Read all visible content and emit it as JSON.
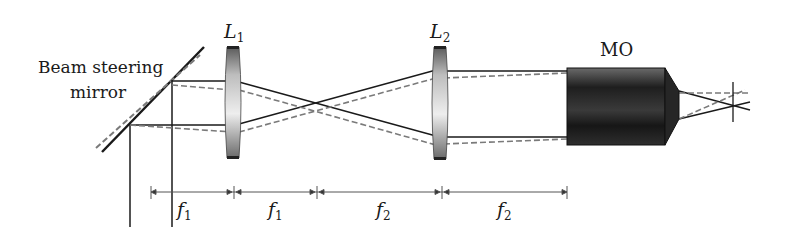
{
  "labels": {
    "mirror_line1": "Beam steering",
    "mirror_line2": "mirror",
    "lens1": {
      "main": "L",
      "sub": "1"
    },
    "lens2": {
      "main": "L",
      "sub": "2"
    },
    "objective": "MO"
  },
  "dimensions": [
    {
      "main": "f",
      "sub": "1"
    },
    {
      "main": "f",
      "sub": "1"
    },
    {
      "main": "f",
      "sub": "2"
    },
    {
      "main": "f",
      "sub": "2"
    }
  ],
  "colors": {
    "ink": "#1a1a1a",
    "dashed": "#7a7a7a",
    "lens_light": "#e8e8e8",
    "lens_dark": "#555555",
    "objective": "#2a2a2a"
  }
}
